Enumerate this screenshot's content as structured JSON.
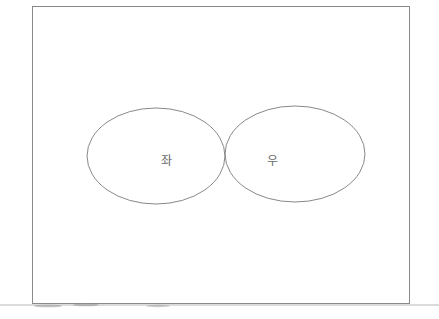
{
  "diagram": {
    "type": "two-ellipse-tangent",
    "frame": {
      "x1": 32,
      "y1": 7,
      "x2": 410,
      "y2": 304,
      "stroke": "#8a8a8a"
    },
    "baseline": {
      "y": 305,
      "x1": 0,
      "x2": 439,
      "stroke": "#b5b5b5"
    },
    "shapes": [
      {
        "id": "left",
        "label": "좌",
        "cx": 156,
        "cy": 156,
        "rx": 69,
        "ry": 48,
        "label_x": 166,
        "label_y": 161
      },
      {
        "id": "right",
        "label": "우",
        "cx": 295,
        "cy": 154,
        "rx": 70,
        "ry": 48,
        "label_x": 272,
        "label_y": 161
      }
    ],
    "stroke_color": "#7a7a7a",
    "label_color": "#6a6a6a"
  },
  "labels": {
    "left": "좌",
    "right": "우"
  }
}
